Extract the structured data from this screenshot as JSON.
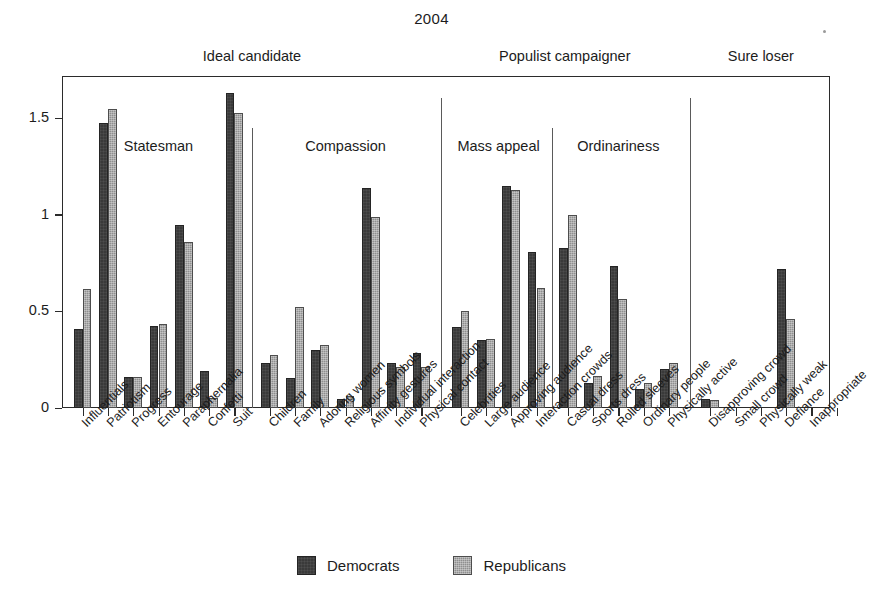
{
  "chart_data": {
    "type": "bar",
    "title": "2004",
    "xlabel": "",
    "ylabel": "",
    "ylim": [
      0,
      1.72
    ],
    "ytick_values": [
      0,
      0.5,
      1,
      1.5
    ],
    "ytick_labels": [
      "0",
      "0.5",
      "1",
      "1.5"
    ],
    "grid": false,
    "legend_position": "bottom-center",
    "series": [
      {
        "name": "Democrats",
        "color": "#3a3a3a",
        "values": [
          0.41,
          1.475,
          0.16,
          0.425,
          0.95,
          0.19,
          1.63,
          0.235,
          0.155,
          0.3,
          0.045,
          1.14,
          0.235,
          0.285,
          0.42,
          0.35,
          1.15,
          0.81,
          0.83,
          0.13,
          0.735,
          0.1,
          0.2,
          0.045,
          0.0,
          0.0,
          0.72,
          0.0
        ]
      },
      {
        "name": "Republicans",
        "color": "#8f8f8f",
        "values": [
          0.615,
          1.55,
          0.16,
          0.435,
          0.86,
          0.05,
          1.53,
          0.275,
          0.525,
          0.325,
          0.06,
          0.99,
          0.215,
          0.215,
          0.505,
          0.36,
          1.13,
          0.62,
          1.0,
          0.165,
          0.565,
          0.13,
          0.235,
          0.04,
          0.0,
          0.0,
          0.46,
          0.0
        ]
      }
    ],
    "categories": [
      "Influentials",
      "Patriotism",
      "Progress",
      "Entourage",
      "Paraphernalia",
      "Confetti",
      "Suit",
      "Children",
      "Family",
      "Adoring women",
      "Religious symbols",
      "Affinity gestures",
      "Individual interaction",
      "Physical contact",
      "Celebrities",
      "Large audience",
      "Approving audience",
      "Interaction crowds",
      "Casual dress",
      "Sports dress",
      "Rolled sleeves",
      "Ordinary people",
      "Physically active",
      "Disapproving crowd",
      "Small crowd",
      "Physically weak",
      "Defiance",
      "Inappropriate"
    ],
    "supergroups": [
      {
        "label": "Ideal candidate",
        "start_index": 0,
        "end_index": 13
      },
      {
        "label": "Populist campaigner",
        "start_index": 14,
        "end_index": 22
      },
      {
        "label": "Sure loser",
        "start_index": 23,
        "end_index": 27
      }
    ],
    "subgroups": [
      {
        "label": "Statesman",
        "start_index": 0,
        "end_index": 6
      },
      {
        "label": "Compassion",
        "start_index": 7,
        "end_index": 13
      },
      {
        "label": "Mass appeal",
        "start_index": 14,
        "end_index": 17
      },
      {
        "label": "Ordinariness",
        "start_index": 18,
        "end_index": 22
      }
    ]
  },
  "legend": {
    "entries": [
      {
        "label": "Democrats"
      },
      {
        "label": "Republicans"
      }
    ]
  }
}
